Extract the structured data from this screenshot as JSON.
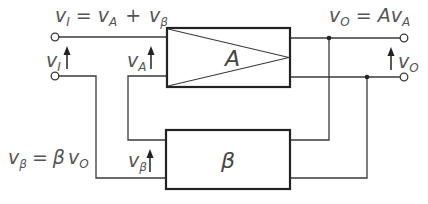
{
  "diagram": {
    "colors": {
      "line": "#3a3a3a",
      "box": "#222222",
      "text": "#555555",
      "background": "#ffffff"
    },
    "blocks": {
      "amplifier": {
        "label": "A"
      },
      "feedback": {
        "label": "β"
      }
    },
    "labels": {
      "input_equation": {
        "lhs": "v",
        "lhs_sub": "I",
        "eq": "=",
        "t1": "v",
        "t1_sub": "A",
        "plus": "+",
        "t2": "v",
        "t2_sub": "β"
      },
      "output_equation": {
        "lhs": "v",
        "lhs_sub": "O",
        "eq": "=",
        "coef": "A",
        "t1": "v",
        "t1_sub": "A"
      },
      "feedback_equation": {
        "lhs": "v",
        "lhs_sub": "β",
        "eq": "=",
        "coef": "β",
        "t1": "v",
        "t1_sub": "O"
      },
      "input_voltage": {
        "sym": "v",
        "sub": "I"
      },
      "amp_input_voltage": {
        "sym": "v",
        "sub": "A"
      },
      "feedback_voltage": {
        "sym": "v",
        "sub": "β"
      },
      "output_voltage": {
        "sym": "v",
        "sub": "O"
      }
    }
  }
}
